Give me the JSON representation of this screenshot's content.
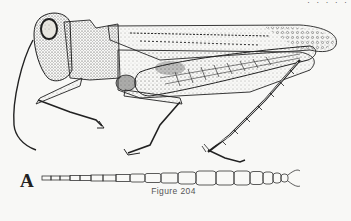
{
  "document": {
    "figure_number_caption": "Figure 204",
    "part_label": "A",
    "top_clipped_text": "· · · · ·",
    "illustration": {
      "subject": "grasshopper (lateral view)",
      "detail": "antenna segments"
    },
    "colors": {
      "ink": "#222222",
      "paper": "#f8f8f6",
      "caption": "#555555"
    }
  }
}
